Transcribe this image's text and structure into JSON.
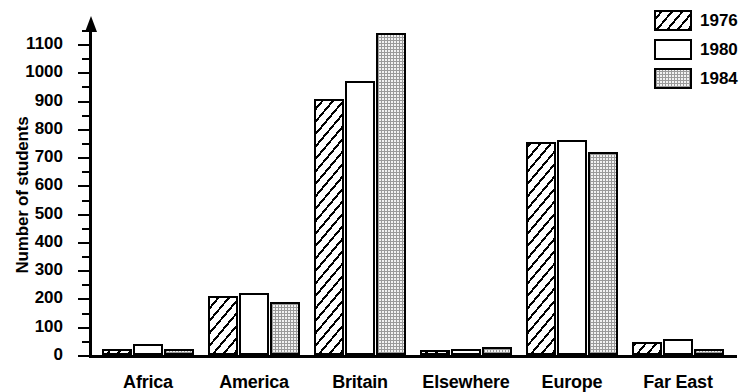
{
  "chart_data": {
    "type": "bar",
    "title": "",
    "xlabel": "",
    "ylabel": "Number of students",
    "ylim": [
      0,
      1150
    ],
    "ytick_step": 100,
    "yticks": [
      0,
      100,
      200,
      300,
      400,
      500,
      600,
      700,
      800,
      900,
      1000,
      1100
    ],
    "ytick_labels": [
      "0",
      "100",
      "200",
      "300",
      "400",
      "500",
      "600",
      "700",
      "800",
      "900",
      "1000",
      "1100"
    ],
    "grid": false,
    "legend_position": "top-right",
    "categories": [
      "Africa",
      "America",
      "Britain",
      "Elsewhere",
      "Europe",
      "Far East"
    ],
    "series": [
      {
        "name": "1976",
        "pattern": "diagonal-hatch",
        "values": [
          22,
          210,
          905,
          15,
          752,
          45
        ]
      },
      {
        "name": "1980",
        "pattern": "white-empty",
        "values": [
          38,
          218,
          970,
          20,
          762,
          58
        ]
      },
      {
        "name": "1984",
        "pattern": "dotted-grey",
        "values": [
          22,
          188,
          1140,
          28,
          718,
          22
        ]
      }
    ]
  },
  "axis": {
    "y_title": "Number of students"
  },
  "legend": {
    "entries": [
      {
        "label": "1976"
      },
      {
        "label": "1980"
      },
      {
        "label": "1984"
      }
    ]
  }
}
